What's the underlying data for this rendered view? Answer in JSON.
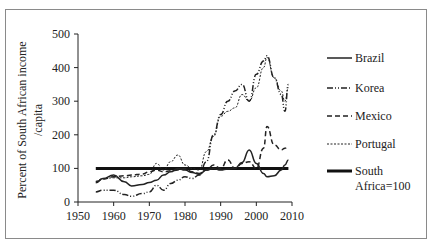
{
  "chart_data": {
    "type": "line",
    "title": "",
    "xlabel": "",
    "ylabel": "Percent of South African income /capita",
    "ylabel_lines": [
      "Percent of South African income",
      "/capita"
    ],
    "xlim": [
      1950,
      2010
    ],
    "ylim": [
      0,
      500
    ],
    "x_ticks": [
      1950,
      1960,
      1970,
      1980,
      1990,
      2000,
      2010
    ],
    "y_ticks": [
      0,
      100,
      200,
      300,
      400,
      500
    ],
    "grid": false,
    "legend_position": "right",
    "x": [
      1955,
      1957,
      1960,
      1963,
      1965,
      1968,
      1970,
      1972,
      1974,
      1976,
      1978,
      1980,
      1982,
      1984,
      1986,
      1988,
      1990,
      1992,
      1994,
      1996,
      1998,
      2000,
      2002,
      2003,
      2005,
      2007,
      2008,
      2009
    ],
    "series": [
      {
        "name": "Brazil",
        "style": "solid",
        "values": [
          57,
          70,
          80,
          60,
          48,
          52,
          58,
          65,
          80,
          90,
          100,
          95,
          88,
          82,
          95,
          100,
          95,
          98,
          100,
          118,
          155,
          115,
          85,
          75,
          78,
          95,
          110,
          125
        ]
      },
      {
        "name": "Korea",
        "style": "dash-dot-dot",
        "values": [
          30,
          35,
          35,
          22,
          17,
          25,
          30,
          50,
          35,
          55,
          65,
          75,
          70,
          80,
          120,
          200,
          260,
          300,
          330,
          350,
          300,
          380,
          420,
          435,
          370,
          320,
          270,
          350
        ]
      },
      {
        "name": "Mexico",
        "style": "dashed",
        "values": [
          60,
          68,
          75,
          78,
          80,
          83,
          90,
          95,
          90,
          93,
          95,
          100,
          90,
          85,
          95,
          110,
          100,
          125,
          100,
          115,
          120,
          100,
          160,
          225,
          170,
          155,
          160,
          165
        ]
      },
      {
        "name": "Portugal",
        "style": "dotted",
        "values": [
          62,
          70,
          72,
          72,
          75,
          78,
          82,
          115,
          95,
          120,
          140,
          110,
          100,
          95,
          150,
          195,
          255,
          270,
          280,
          320,
          300,
          340,
          400,
          430,
          370,
          330,
          300,
          340
        ]
      },
      {
        "name": "South Africa=100",
        "style": "thick-solid",
        "values": [
          100,
          100,
          100,
          100,
          100,
          100,
          100,
          100,
          100,
          100,
          100,
          100,
          100,
          100,
          100,
          100,
          100,
          100,
          100,
          100,
          100,
          100,
          100,
          100,
          100,
          100,
          100,
          100
        ]
      }
    ]
  },
  "legend": {
    "items": [
      {
        "label": "Brazil"
      },
      {
        "label": "Korea"
      },
      {
        "label": "Mexico"
      },
      {
        "label": "Portugal"
      },
      {
        "label_line1": "South",
        "label_line2": "Africa=100"
      }
    ]
  },
  "axes": {
    "x_labels": [
      "1950",
      "1960",
      "1970",
      "1980",
      "1990",
      "2000",
      "2010"
    ],
    "y_labels": [
      "0",
      "100",
      "200",
      "300",
      "400",
      "500"
    ]
  },
  "colors": {
    "line": "#222222",
    "frame": "#8a8a8a"
  }
}
